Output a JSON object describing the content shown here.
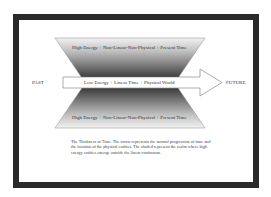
{
  "diagram": {
    "top_region_label": "High Energy + Non-Linear-Non-Physical + Present Time",
    "bottom_region_label": "High Energy + Non-Linear-Non-Physical + Present Time",
    "arrow_label": "Low Energy + Linear Time + Physical World",
    "left_label": "PAST",
    "right_label": "FUTURE",
    "caption": "The Thickness of Time. The arrow represents the normal progression of time and the location of the physical entities. The shaded represent the realm where high energy entities emerge outside the linear continuum.",
    "colors": {
      "frame": "#2a2a2a",
      "shade_dark": "#3a3a3a",
      "shade_light": "#f2f2f2",
      "arrow_fill": "#ffffff",
      "arrow_stroke": "#777777"
    }
  }
}
